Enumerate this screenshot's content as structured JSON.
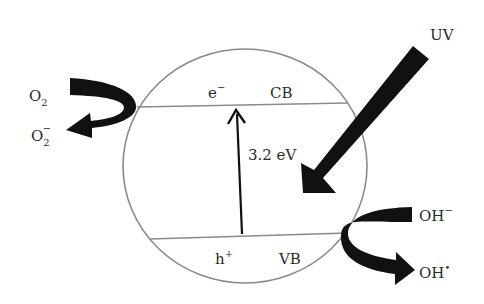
{
  "diagram": {
    "type": "photocatalysis-band-diagram",
    "particle": {
      "shape": "circle",
      "stroke_color": "#8a8a8a"
    },
    "bands": {
      "conduction": {
        "label": "CB",
        "carrier": "e",
        "carrier_sup": "−"
      },
      "valence": {
        "label": "VB",
        "carrier": "h",
        "carrier_sup": "+"
      }
    },
    "band_gap": {
      "label": "3.2 eV"
    },
    "light": {
      "label": "UV"
    },
    "reduction": {
      "reactant": {
        "base": "O",
        "sub": "2"
      },
      "product": {
        "base": "O",
        "sub": "2",
        "sup": "−"
      }
    },
    "oxidation": {
      "reactant": {
        "base": "OH",
        "sup": "−"
      },
      "product": {
        "base": "OH",
        "sup": "•"
      }
    },
    "colors": {
      "arrow_fill": "#111111",
      "line": "#8a8a8a",
      "text": "#2a2a2a"
    }
  }
}
